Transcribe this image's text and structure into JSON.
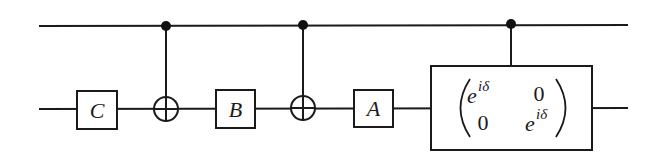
{
  "diagram": {
    "type": "quantum-circuit",
    "qubits": 2,
    "wires": [
      {
        "id": "control-wire",
        "y": 26
      },
      {
        "id": "target-wire",
        "y": 109
      }
    ],
    "gates": [
      {
        "type": "single",
        "label": "C",
        "wire": 1
      },
      {
        "type": "cnot",
        "control": 0,
        "target": 1
      },
      {
        "type": "single",
        "label": "B",
        "wire": 1
      },
      {
        "type": "cnot",
        "control": 0,
        "target": 1
      },
      {
        "type": "single",
        "label": "A",
        "wire": 1
      },
      {
        "type": "controlled-matrix",
        "control": 0,
        "target": 1,
        "matrix": {
          "m00_base": "e",
          "m00_sup": "iδ",
          "m01": "0",
          "m10": "0",
          "m11_base": "e",
          "m11_sup": "iδ"
        }
      }
    ]
  },
  "labels": {
    "gate_c": "C",
    "gate_b": "B",
    "gate_a": "A",
    "m00_base": "e",
    "m00_sup": "iδ",
    "m01": "0",
    "m10": "0",
    "m11_base": "e",
    "m11_sup": "iδ"
  },
  "colors": {
    "line": "#1a1a1a",
    "background": "#ffffff"
  }
}
